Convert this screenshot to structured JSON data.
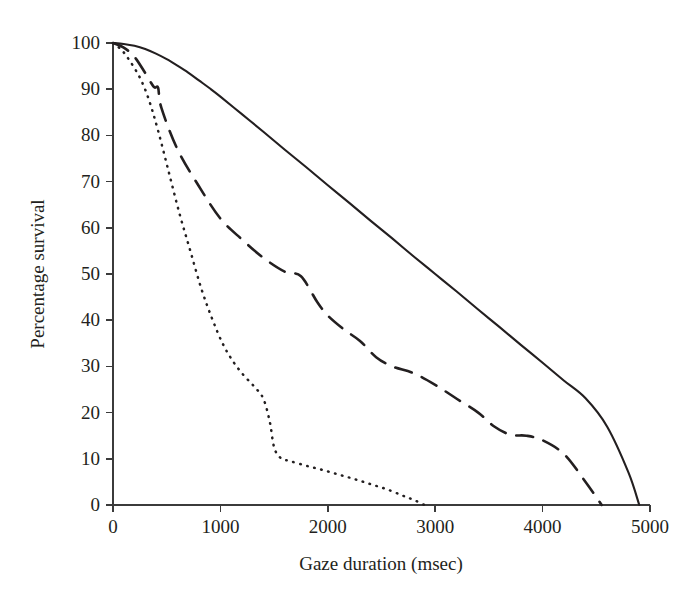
{
  "figure": {
    "background_color": "#ffffff",
    "ink_color": "#231f20"
  },
  "chart_data": {
    "type": "line",
    "title": "",
    "subtitle": "",
    "xlabel": "Gaze duration (msec)",
    "ylabel": "Percentage survival",
    "xlim": [
      0,
      5000
    ],
    "ylim": [
      0,
      100
    ],
    "xticks": [
      0,
      1000,
      2000,
      3000,
      4000,
      5000
    ],
    "yticks": [
      0,
      10,
      20,
      30,
      40,
      50,
      60,
      70,
      80,
      90,
      100
    ],
    "xtick_labels": [
      "0",
      "1000",
      "2000",
      "3000",
      "4000",
      "5000"
    ],
    "ytick_labels": [
      "0",
      "10",
      "20",
      "30",
      "40",
      "50",
      "60",
      "70",
      "80",
      "90",
      "100"
    ],
    "grid": false,
    "legend": "none",
    "annotations": [],
    "series": [
      {
        "name": "solid-curve",
        "style": "solid",
        "color": "#231f20",
        "x": [
          0,
          100,
          200,
          300,
          400,
          500,
          600,
          700,
          800,
          900,
          1000,
          1200,
          1400,
          1600,
          1800,
          2000,
          2200,
          2400,
          2600,
          2800,
          3000,
          3200,
          3400,
          3600,
          3800,
          4000,
          4200,
          4400,
          4600,
          4800,
          4900
        ],
        "y": [
          100,
          99.8,
          99.4,
          98.7,
          97.7,
          96.5,
          95.1,
          93.6,
          91.9,
          90.2,
          88.4,
          84.6,
          80.8,
          76.9,
          73.1,
          69.2,
          65.4,
          61.5,
          57.7,
          53.8,
          50.0,
          46.2,
          42.3,
          38.5,
          34.6,
          30.8,
          26.9,
          23.1,
          17.0,
          7.0,
          0
        ]
      },
      {
        "name": "dashed-curve",
        "style": "dashed",
        "color": "#231f20",
        "x": [
          0,
          100,
          200,
          300,
          380,
          420,
          450,
          600,
          800,
          1000,
          1200,
          1400,
          1600,
          1750,
          1900,
          2000,
          2150,
          2300,
          2450,
          2600,
          2800,
          3000,
          3200,
          3400,
          3550,
          3700,
          3850,
          4000,
          4200,
          4400,
          4550
        ],
        "y": [
          100,
          99.0,
          97.0,
          93.5,
          90.5,
          90.3,
          86.0,
          77.0,
          69.0,
          62.0,
          57.5,
          53.5,
          50.5,
          49.5,
          44.0,
          41.0,
          38.0,
          35.5,
          32.0,
          30.0,
          28.5,
          26.0,
          23.0,
          20.0,
          17.0,
          15.2,
          15.0,
          14.0,
          11.0,
          5.0,
          0
        ]
      },
      {
        "name": "dotted-curve",
        "style": "dotted",
        "color": "#231f20",
        "x": [
          0,
          80,
          160,
          250,
          330,
          420,
          520,
          620,
          720,
          820,
          920,
          1020,
          1120,
          1220,
          1320,
          1400,
          1460,
          1500,
          1560,
          1650,
          1800,
          1950,
          2100,
          2250,
          2400,
          2550,
          2700,
          2800,
          2900
        ],
        "y": [
          100,
          98.5,
          96.0,
          92.5,
          88.0,
          81.0,
          72.0,
          63.0,
          55.0,
          47.0,
          40.5,
          35.0,
          31.0,
          28.0,
          25.5,
          23.0,
          18.0,
          12.5,
          10.2,
          9.5,
          8.5,
          7.6,
          6.6,
          5.6,
          4.5,
          3.4,
          2.0,
          1.1,
          0
        ]
      }
    ]
  }
}
